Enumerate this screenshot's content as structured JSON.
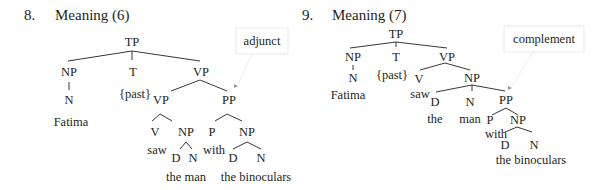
{
  "trees": [
    {
      "number": "8.",
      "title": "Meaning (6)",
      "callout": "adjunct",
      "nodes": {
        "tp": "TP",
        "np": "NP",
        "t": "T",
        "vp": "VP",
        "n": "N",
        "past": "{past}",
        "fatima": "Fatima",
        "vp2": "VP",
        "pp": "PP",
        "v": "V",
        "np2": "NP",
        "p": "P",
        "np3": "NP",
        "saw": "saw",
        "d1": "D",
        "n1": "N",
        "with": "with",
        "d2": "D",
        "n2": "N",
        "theman": "the man",
        "thebinoculars": "the binoculars"
      }
    },
    {
      "number": "9.",
      "title": "Meaning (7)",
      "callout": "complement",
      "nodes": {
        "tp": "TP",
        "np": "NP",
        "t": "T",
        "vp": "VP",
        "n": "N",
        "past": "{past}",
        "fatima": "Fatima",
        "v": "V",
        "np2": "NP",
        "saw": "saw",
        "d1": "D",
        "n1": "N",
        "pp": "PP",
        "the": "the",
        "man": "man",
        "p": "P",
        "np3": "NP",
        "with": "with",
        "d2": "D",
        "n2": "N",
        "thebinoculars": "the binoculars"
      }
    }
  ]
}
